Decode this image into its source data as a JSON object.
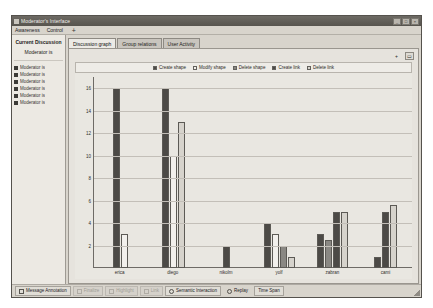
{
  "window": {
    "title": "Moderator's Interface",
    "icon": "app-icon",
    "buttons": [
      {
        "name": "minimize-button",
        "glyph": "_"
      },
      {
        "name": "maximize-button",
        "glyph": "□"
      },
      {
        "name": "close-button",
        "glyph": "×"
      }
    ]
  },
  "menubar": {
    "items": [
      {
        "label": "Awareness"
      },
      {
        "label": "Control"
      }
    ],
    "add_label": "+"
  },
  "sidebar": {
    "title": "Current Discussion",
    "subtitle": "Moderator is",
    "users": [
      {
        "label": "Moderator is"
      },
      {
        "label": "Moderator is"
      },
      {
        "label": "Moderator is"
      },
      {
        "label": "Moderator is"
      },
      {
        "label": "Moderator is"
      },
      {
        "label": "Moderator is"
      }
    ]
  },
  "tabs": [
    {
      "label": "Discussion graph",
      "active": true
    },
    {
      "label": "Group relations",
      "active": false
    },
    {
      "label": "User Activity",
      "active": false
    }
  ],
  "toolbar": {
    "add_label": "+",
    "view_label": "▭"
  },
  "bottombar": {
    "buttons": [
      {
        "label": "Message Annotation",
        "icon": "tag-icon",
        "disabled": false
      },
      {
        "label": "Finalize",
        "icon": "check-icon",
        "disabled": true
      },
      {
        "label": "Highlight",
        "icon": "pen-icon",
        "disabled": true
      },
      {
        "label": "Link",
        "icon": "link-icon",
        "disabled": true
      },
      {
        "label": "Semantic Interaction",
        "icon": "clock-icon",
        "disabled": false
      },
      {
        "label": "Replay",
        "icon": "play-icon",
        "disabled": false
      },
      {
        "label": "Time Span",
        "icon": "span-icon",
        "disabled": false
      }
    ]
  },
  "chart_data": {
    "type": "bar",
    "title": "",
    "xlabel": "",
    "ylabel": "",
    "grid": true,
    "legend_position": "top",
    "ylim": [
      0,
      17
    ],
    "yticks": [
      16,
      14,
      12,
      10,
      8,
      6,
      4,
      2
    ],
    "categories": [
      "erica",
      "diego",
      "nikolm",
      "yolf",
      "zabran",
      "cami"
    ],
    "series": [
      {
        "name": "Create shape",
        "color": "#4c4a46",
        "values": [
          16,
          16,
          2,
          4,
          3,
          1
        ]
      },
      {
        "name": "Modify shape",
        "color": "#f2f0ec",
        "values": [
          3,
          10,
          0,
          3,
          0,
          0
        ]
      },
      {
        "name": "Delete shape",
        "color": "#8a8883",
        "values": [
          0,
          0,
          0,
          2,
          2.5,
          0
        ]
      },
      {
        "name": "Create link",
        "color": "#4c4a46",
        "values": [
          0,
          0,
          0,
          0,
          5,
          5
        ]
      },
      {
        "name": "Delete link",
        "color": "#d6d3cc",
        "values": [
          0,
          13,
          0,
          1,
          5,
          5.6
        ]
      }
    ]
  }
}
